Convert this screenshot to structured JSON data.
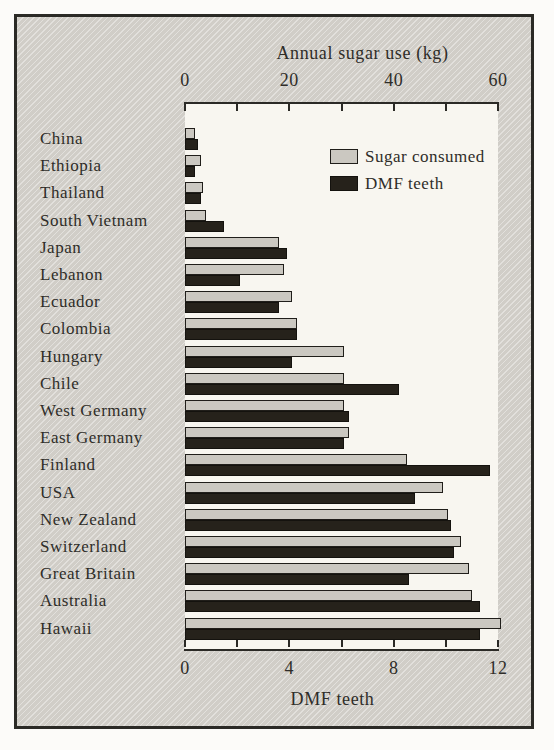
{
  "chart_data": {
    "type": "bar",
    "orientation": "horizontal",
    "categories": [
      "China",
      "Ethiopia",
      "Thailand",
      "South Vietnam",
      "Japan",
      "Lebanon",
      "Ecuador",
      "Colombia",
      "Hungary",
      "Chile",
      "West Germany",
      "East Germany",
      "Finland",
      "USA",
      "New Zealand",
      "Switzerland",
      "Great Britain",
      "Australia",
      "Hawaii"
    ],
    "series": [
      {
        "name": "Sugar consumed",
        "key": "sugar",
        "axis": "top",
        "unit": "kg per year",
        "values": [
          2,
          3,
          3.5,
          4,
          18,
          19,
          20.5,
          21.5,
          30.5,
          30.5,
          30.5,
          31.5,
          42.5,
          49.5,
          50.5,
          53,
          54.5,
          55,
          60.5
        ]
      },
      {
        "name": "DMF teeth",
        "key": "dmf",
        "axis": "bottom",
        "unit": "teeth",
        "values": [
          0.5,
          0.4,
          0.6,
          1.5,
          3.9,
          2.1,
          3.6,
          4.3,
          4.1,
          8.2,
          6.3,
          6.1,
          11.7,
          8.8,
          10.2,
          10.3,
          8.6,
          11.3,
          11.3
        ]
      }
    ],
    "top_axis": {
      "label": "Annual sugar use (kg)",
      "range": [
        0,
        60
      ],
      "ticks": [
        0,
        10,
        20,
        30,
        40,
        50,
        60
      ],
      "labeled_ticks": [
        0,
        20,
        40,
        60
      ]
    },
    "bottom_axis": {
      "label": "DMF teeth",
      "range": [
        0,
        12
      ],
      "ticks": [
        0,
        2,
        4,
        6,
        8,
        10,
        12
      ],
      "labeled_ticks": [
        0,
        4,
        8,
        12
      ]
    },
    "legend_position": "top-right-inside-plot",
    "grid": false,
    "colors": {
      "sugar": "#cbc8c1",
      "dmf": "#26221b",
      "panel": "#d6d3cd",
      "plot_background": "#f8f6f0",
      "frame_border": "#2b2a26",
      "text": "#2f2d29"
    }
  }
}
